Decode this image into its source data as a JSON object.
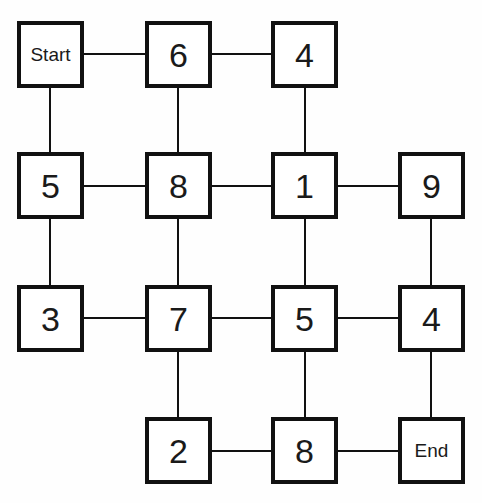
{
  "diagram": {
    "background_color": "#fefefe",
    "node_fill_color": "#ffffff",
    "node_border_color": "#111111",
    "edge_color": "#111111",
    "grid": {
      "columns": 4,
      "rows": 4
    },
    "nodes": [
      {
        "id": "n-r1c1",
        "label": "Start",
        "kind": "word",
        "col": 1,
        "row": 1,
        "x": 17,
        "y": 21,
        "w": 67,
        "h": 67
      },
      {
        "id": "n-r1c2",
        "label": "6",
        "kind": "num",
        "col": 2,
        "row": 1,
        "x": 145,
        "y": 21,
        "w": 67,
        "h": 67
      },
      {
        "id": "n-r1c3",
        "label": "4",
        "kind": "num",
        "col": 3,
        "row": 1,
        "x": 271,
        "y": 21,
        "w": 67,
        "h": 67
      },
      {
        "id": "n-r2c1",
        "label": "5",
        "kind": "num",
        "col": 1,
        "row": 2,
        "x": 17,
        "y": 152,
        "w": 67,
        "h": 67
      },
      {
        "id": "n-r2c2",
        "label": "8",
        "kind": "num",
        "col": 2,
        "row": 2,
        "x": 145,
        "y": 152,
        "w": 67,
        "h": 67
      },
      {
        "id": "n-r2c3",
        "label": "1",
        "kind": "num",
        "col": 3,
        "row": 2,
        "x": 271,
        "y": 152,
        "w": 67,
        "h": 67
      },
      {
        "id": "n-r2c4",
        "label": "9",
        "kind": "num",
        "col": 4,
        "row": 2,
        "x": 398,
        "y": 152,
        "w": 67,
        "h": 67
      },
      {
        "id": "n-r3c1",
        "label": "3",
        "kind": "num",
        "col": 1,
        "row": 3,
        "x": 17,
        "y": 285,
        "w": 67,
        "h": 67
      },
      {
        "id": "n-r3c2",
        "label": "7",
        "kind": "num",
        "col": 2,
        "row": 3,
        "x": 145,
        "y": 285,
        "w": 67,
        "h": 67
      },
      {
        "id": "n-r3c3",
        "label": "5",
        "kind": "num",
        "col": 3,
        "row": 3,
        "x": 271,
        "y": 285,
        "w": 67,
        "h": 67
      },
      {
        "id": "n-r3c4",
        "label": "4",
        "kind": "num",
        "col": 4,
        "row": 3,
        "x": 398,
        "y": 285,
        "w": 67,
        "h": 67
      },
      {
        "id": "n-r4c2",
        "label": "2",
        "kind": "num",
        "col": 2,
        "row": 4,
        "x": 145,
        "y": 417,
        "w": 67,
        "h": 67
      },
      {
        "id": "n-r4c3",
        "label": "8",
        "kind": "num",
        "col": 3,
        "row": 4,
        "x": 271,
        "y": 417,
        "w": 67,
        "h": 67
      },
      {
        "id": "n-r4c4",
        "label": "End",
        "kind": "word",
        "col": 4,
        "row": 4,
        "x": 398,
        "y": 417,
        "w": 67,
        "h": 67
      }
    ],
    "edges": [
      {
        "id": "e-start-6",
        "from": "n-r1c1",
        "to": "n-r1c2",
        "orientation": "horizontal",
        "x1": 84,
        "y1": 54,
        "x2": 145,
        "y2": 54
      },
      {
        "id": "e-6-4",
        "from": "n-r1c2",
        "to": "n-r1c3",
        "orientation": "horizontal",
        "x1": 212,
        "y1": 54,
        "x2": 271,
        "y2": 54
      },
      {
        "id": "e-5-8",
        "from": "n-r2c1",
        "to": "n-r2c2",
        "orientation": "horizontal",
        "x1": 84,
        "y1": 186,
        "x2": 145,
        "y2": 186
      },
      {
        "id": "e-8-1",
        "from": "n-r2c2",
        "to": "n-r2c3",
        "orientation": "horizontal",
        "x1": 212,
        "y1": 186,
        "x2": 271,
        "y2": 186
      },
      {
        "id": "e-1-9",
        "from": "n-r2c3",
        "to": "n-r2c4",
        "orientation": "horizontal",
        "x1": 338,
        "y1": 186,
        "x2": 398,
        "y2": 186
      },
      {
        "id": "e-3-7",
        "from": "n-r3c1",
        "to": "n-r3c2",
        "orientation": "horizontal",
        "x1": 84,
        "y1": 318,
        "x2": 145,
        "y2": 318
      },
      {
        "id": "e-7-5",
        "from": "n-r3c2",
        "to": "n-r3c3",
        "orientation": "horizontal",
        "x1": 212,
        "y1": 318,
        "x2": 271,
        "y2": 318
      },
      {
        "id": "e-5-4",
        "from": "n-r3c3",
        "to": "n-r3c4",
        "orientation": "horizontal",
        "x1": 338,
        "y1": 318,
        "x2": 398,
        "y2": 318
      },
      {
        "id": "e-2-8",
        "from": "n-r4c2",
        "to": "n-r4c3",
        "orientation": "horizontal",
        "x1": 212,
        "y1": 451,
        "x2": 271,
        "y2": 451
      },
      {
        "id": "e-8-end",
        "from": "n-r4c3",
        "to": "n-r4c4",
        "orientation": "horizontal",
        "x1": 338,
        "y1": 451,
        "x2": 398,
        "y2": 451
      },
      {
        "id": "e-start-5",
        "from": "n-r1c1",
        "to": "n-r2c1",
        "orientation": "vertical",
        "x1": 50,
        "y1": 88,
        "x2": 50,
        "y2": 152
      },
      {
        "id": "e-5-3",
        "from": "n-r2c1",
        "to": "n-r3c1",
        "orientation": "vertical",
        "x1": 50,
        "y1": 219,
        "x2": 50,
        "y2": 285
      },
      {
        "id": "e-6-8",
        "from": "n-r1c2",
        "to": "n-r2c2",
        "orientation": "vertical",
        "x1": 178,
        "y1": 88,
        "x2": 178,
        "y2": 152
      },
      {
        "id": "e-8-7",
        "from": "n-r2c2",
        "to": "n-r3c2",
        "orientation": "vertical",
        "x1": 178,
        "y1": 219,
        "x2": 178,
        "y2": 285
      },
      {
        "id": "e-7-2",
        "from": "n-r3c2",
        "to": "n-r4c2",
        "orientation": "vertical",
        "x1": 178,
        "y1": 352,
        "x2": 178,
        "y2": 417
      },
      {
        "id": "e-4-1",
        "from": "n-r1c3",
        "to": "n-r2c3",
        "orientation": "vertical",
        "x1": 305,
        "y1": 88,
        "x2": 305,
        "y2": 152
      },
      {
        "id": "e-1-5",
        "from": "n-r2c3",
        "to": "n-r3c3",
        "orientation": "vertical",
        "x1": 305,
        "y1": 219,
        "x2": 305,
        "y2": 285
      },
      {
        "id": "e-5-8b",
        "from": "n-r3c3",
        "to": "n-r4c3",
        "orientation": "vertical",
        "x1": 305,
        "y1": 352,
        "x2": 305,
        "y2": 417
      },
      {
        "id": "e-9-4",
        "from": "n-r2c4",
        "to": "n-r3c4",
        "orientation": "vertical",
        "x1": 431,
        "y1": 219,
        "x2": 431,
        "y2": 285
      },
      {
        "id": "e-4-end",
        "from": "n-r3c4",
        "to": "n-r4c4",
        "orientation": "vertical",
        "x1": 431,
        "y1": 352,
        "x2": 431,
        "y2": 417
      }
    ]
  }
}
